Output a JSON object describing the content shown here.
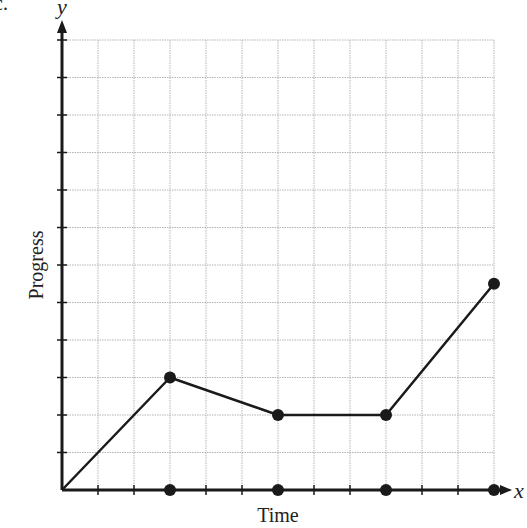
{
  "page": {
    "corner_fragment": "c."
  },
  "chart_data": {
    "type": "line",
    "title": "",
    "xlabel": "Time",
    "ylabel": "Progress",
    "x_axis_symbol": "x",
    "y_axis_symbol": "y",
    "x_tick_labels": [],
    "y_tick_labels": [],
    "xlim": [
      0,
      12
    ],
    "ylim": [
      0,
      12
    ],
    "grid": true,
    "grid_style": "dotted",
    "x": [
      0,
      3,
      6,
      9,
      12
    ],
    "series": [
      {
        "name": "Progress",
        "values": [
          0,
          3,
          2,
          2,
          5.5
        ]
      }
    ],
    "x_axis_markers": [
      3,
      6,
      9,
      12
    ],
    "legend": null
  },
  "style": {
    "line_color": "#1a1a1a",
    "grid_color": "#b5b5b5",
    "axis_color": "#1a1a1a"
  }
}
